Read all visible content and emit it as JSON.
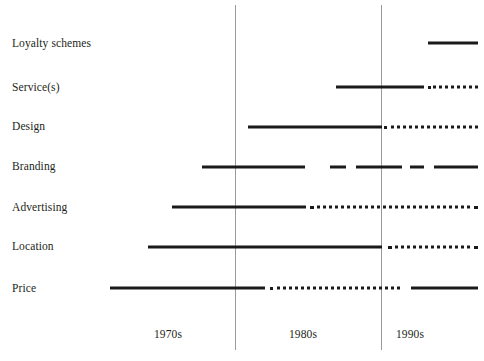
{
  "chart_data": {
    "type": "timeline",
    "title": "",
    "subtitle": "",
    "xlabel": "",
    "ylabel": "",
    "grid": false,
    "legend_position": "none",
    "xlim_px": [
      0,
      484
    ],
    "axis_style": {
      "line_color": "#1a1a1a",
      "divider_color": "#9a9a9a",
      "text_color": "#231f20",
      "background": "#ffffff"
    },
    "x_ticks": [
      {
        "label": "1970s",
        "x": 168,
        "y": 334
      },
      {
        "label": "1980s",
        "x": 303,
        "y": 334
      },
      {
        "label": "1990s",
        "x": 410,
        "y": 334
      }
    ],
    "dividers": [
      {
        "x": 235,
        "y_top": 5,
        "height": 345
      },
      {
        "x": 381,
        "y_top": 5,
        "height": 345
      }
    ],
    "categories": [
      "Loyalty schemes",
      "Service(s)",
      "Design",
      "Branding",
      "Advertising",
      "Location",
      "Price"
    ],
    "rows": [
      {
        "label": "Loyalty schemes",
        "label_y": 44,
        "line_y": 43,
        "segments": [
          {
            "style": "solid",
            "x1": 428,
            "x2": 478
          }
        ]
      },
      {
        "label": "Service(s)",
        "label_y": 88,
        "line_y": 87,
        "segments": [
          {
            "style": "solid",
            "x1": 336,
            "x2": 424
          },
          {
            "style": "dotted",
            "x1": 428,
            "x2": 478
          }
        ]
      },
      {
        "label": "Design",
        "label_y": 127,
        "line_y": 127,
        "segments": [
          {
            "style": "solid",
            "x1": 248,
            "x2": 382
          },
          {
            "style": "dotted",
            "x1": 384,
            "x2": 478
          }
        ]
      },
      {
        "label": "Branding",
        "label_y": 167,
        "line_y": 167,
        "segments": [
          {
            "style": "solid",
            "x1": 202,
            "x2": 305
          },
          {
            "style": "solid",
            "x1": 330,
            "x2": 346
          },
          {
            "style": "solid",
            "x1": 356,
            "x2": 402
          },
          {
            "style": "solid",
            "x1": 410,
            "x2": 424
          },
          {
            "style": "solid",
            "x1": 434,
            "x2": 478
          }
        ]
      },
      {
        "label": "Advertising",
        "label_y": 208,
        "line_y": 207,
        "segments": [
          {
            "style": "solid",
            "x1": 172,
            "x2": 306
          },
          {
            "style": "dotted",
            "x1": 310,
            "x2": 478
          }
        ]
      },
      {
        "label": "Location",
        "label_y": 247,
        "line_y": 247,
        "segments": [
          {
            "style": "solid",
            "x1": 148,
            "x2": 382
          },
          {
            "style": "dotted",
            "x1": 388,
            "x2": 478
          }
        ]
      },
      {
        "label": "Price",
        "label_y": 289,
        "line_y": 288,
        "segments": [
          {
            "style": "solid",
            "x1": 110,
            "x2": 265
          },
          {
            "style": "dotted",
            "x1": 270,
            "x2": 400
          },
          {
            "style": "solid",
            "x1": 411,
            "x2": 478
          }
        ]
      }
    ]
  }
}
